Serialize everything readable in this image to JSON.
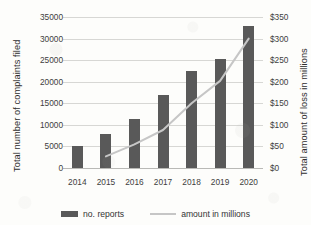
{
  "chart_data": {
    "type": "bar",
    "title": "",
    "subtitle": "",
    "categories": [
      "2014",
      "2015",
      "2016",
      "2017",
      "2018",
      "2019",
      "2020"
    ],
    "series": [
      {
        "name": "no. reports",
        "type": "bar",
        "axis": "left",
        "color": "#595959",
        "values": [
          5200,
          8000,
          11300,
          17000,
          22400,
          25300,
          33000
        ]
      },
      {
        "name": "amount in millions",
        "type": "line",
        "axis": "right",
        "color": "#c6c6c6",
        "values": [
          null,
          27,
          55,
          88,
          150,
          202,
          300
        ]
      }
    ],
    "xlabel": "",
    "ylabel": "Total number of complaints filed",
    "ylabel_right": "Total amount of loss in millions",
    "ylim": [
      0,
      35000
    ],
    "ylim_right": [
      0,
      350
    ],
    "yticks": [
      0,
      5000,
      10000,
      15000,
      20000,
      25000,
      30000,
      35000
    ],
    "ytick_labels": [
      "0",
      "5000",
      "10000",
      "15000",
      "20000",
      "25000",
      "30000",
      "35000"
    ],
    "yticks_right": [
      0,
      50,
      100,
      150,
      200,
      250,
      300,
      350
    ],
    "ytick_labels_right": [
      "$0",
      "$50",
      "$100",
      "$150",
      "$200",
      "$250",
      "$300",
      "$350"
    ],
    "grid": true,
    "legend_position": "bottom",
    "legend_entries": [
      "no. reports",
      "amount in millions"
    ]
  },
  "legend": {
    "bar_label": "no. reports",
    "line_label": "amount in millions"
  },
  "colors": {
    "bar": "#595959",
    "line": "#c6c6c6",
    "grid": "#d7d7d4",
    "background": "#fdfdfb",
    "text": "#3a3a3a"
  }
}
